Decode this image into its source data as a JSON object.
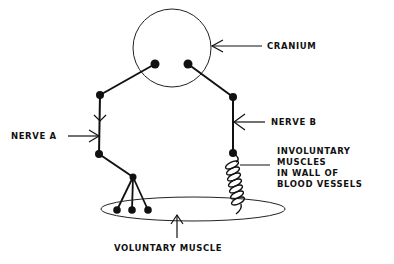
{
  "diagram": {
    "type": "nervous system schematic",
    "labels": {
      "cranium": "CRANIUM",
      "nerve_a": "NERVE A",
      "nerve_b": "NERVE B",
      "involuntary_line1": "INVOLUNTARY",
      "involuntary_line2": "MUSCLES",
      "involuntary_line3": "IN WALL OF",
      "involuntary_line4": "BLOOD VESSELS",
      "voluntary_muscle": "VOLUNTARY MUSCLE"
    },
    "colors": {
      "ink": "#111111",
      "background": "#ffffff"
    }
  }
}
